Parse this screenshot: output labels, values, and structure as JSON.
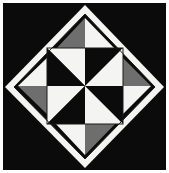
{
  "canvas": {
    "width": 169,
    "height": 173,
    "background_color": "#ffffff",
    "title": "Pinwheel Quilt Block"
  },
  "palette": {
    "black": "#0b0b0b",
    "white": "#f4f4f2",
    "gray": "#6e6e6e",
    "outline": "#1a1a1a",
    "page_background": "#ffffff"
  },
  "artwork": {
    "name": "pinwheel-quilt-block",
    "description": "Black square panel containing a white-bordered diamond; inside the diamond a rotated inner square holds a four-patch black-and-white pinwheel, and the four diamond corner triangles are each split into a gray half and a white half in rotational symmetry.",
    "background_panel": {
      "name": "black-panel",
      "x": 3,
      "y": 3,
      "width": 163,
      "height": 167,
      "fill": "#0b0b0b"
    },
    "diamond": {
      "name": "white-diamond",
      "fill": "#f4f4f2",
      "points": "85,5 164,87 85,168 5,87"
    },
    "diamond_inner": {
      "name": "diamond-inner-field",
      "fill": "#0b0b0b",
      "points": "85,14 155,87 85,159 14,87"
    },
    "inner_square": {
      "name": "inner-pinwheel-square",
      "x": 47,
      "y": 48,
      "width": 76,
      "height": 76,
      "center_x": 85,
      "center_y": 86
    },
    "corner_triangles": [
      {
        "name": "corner-triangle-top",
        "position": "top",
        "halves": [
          {
            "name": "top-left-half",
            "fill": "#6e6e6e",
            "points": "85,18 85,50 55,50"
          },
          {
            "name": "top-right-half",
            "fill": "#f4f4f2",
            "points": "85,18 116,50 85,50"
          }
        ]
      },
      {
        "name": "corner-triangle-right",
        "position": "right",
        "halves": [
          {
            "name": "top-half",
            "fill": "#6e6e6e",
            "points": "151,86 120,86 120,55"
          },
          {
            "name": "bottom-half",
            "fill": "#f4f4f2",
            "points": "151,86 120,117 120,86"
          }
        ]
      },
      {
        "name": "corner-triangle-bottom",
        "position": "bottom",
        "halves": [
          {
            "name": "bottom-right-half",
            "fill": "#6e6e6e",
            "points": "85,155 85,123 116,123"
          },
          {
            "name": "bottom-left-half",
            "fill": "#f4f4f2",
            "points": "85,155 55,123 85,123"
          }
        ]
      },
      {
        "name": "corner-triangle-left",
        "position": "left",
        "halves": [
          {
            "name": "bottom-half",
            "fill": "#6e6e6e",
            "points": "18,86 50,86 50,117"
          },
          {
            "name": "top-half",
            "fill": "#f4f4f2",
            "points": "18,86 50,55 50,86"
          }
        ]
      }
    ],
    "pinwheel_cells": [
      {
        "name": "pinwheel-cell-top-left",
        "row": 0,
        "col": 0,
        "diagonal": "nw-se",
        "triangles": [
          {
            "name": "tl-upper-right",
            "fill": "#f4f4f2",
            "points": "47,48 85,48 85,86"
          },
          {
            "name": "tl-lower-left",
            "fill": "#0b0b0b",
            "points": "47,48 85,86 47,86"
          }
        ]
      },
      {
        "name": "pinwheel-cell-top-right",
        "row": 0,
        "col": 1,
        "diagonal": "sw-ne",
        "triangles": [
          {
            "name": "tr-upper-left",
            "fill": "#0b0b0b",
            "points": "85,48 123,48 85,86"
          },
          {
            "name": "tr-lower-right",
            "fill": "#f4f4f2",
            "points": "123,48 123,86 85,86"
          }
        ]
      },
      {
        "name": "pinwheel-cell-bottom-left",
        "row": 1,
        "col": 0,
        "diagonal": "sw-ne",
        "triangles": [
          {
            "name": "bl-upper-left",
            "fill": "#f4f4f2",
            "points": "47,86 85,86 47,124"
          },
          {
            "name": "bl-lower-right",
            "fill": "#0b0b0b",
            "points": "85,86 85,124 47,124"
          }
        ]
      },
      {
        "name": "pinwheel-cell-bottom-right",
        "row": 1,
        "col": 1,
        "diagonal": "nw-se",
        "triangles": [
          {
            "name": "br-upper-right",
            "fill": "#0b0b0b",
            "points": "85,86 123,86 123,124"
          },
          {
            "name": "br-lower-left",
            "fill": "#f4f4f2",
            "points": "85,86 123,124 85,124"
          }
        ]
      }
    ],
    "outlines": [
      {
        "name": "inner-square-outline",
        "stroke": "#1a1a1a",
        "width": 1
      },
      {
        "name": "diamond-outline",
        "stroke": "#1a1a1a",
        "width": 1
      }
    ]
  }
}
